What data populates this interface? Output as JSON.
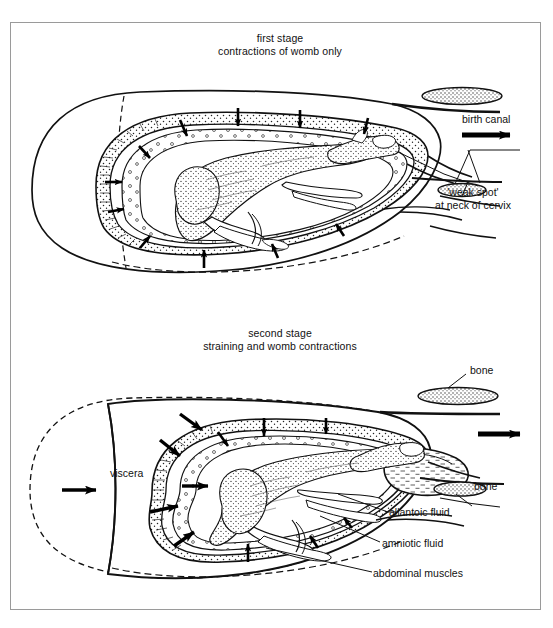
{
  "figure": {
    "background_color": "#ffffff",
    "ink_color": "#111111",
    "frame_color": "#9a9a9a"
  },
  "panels": [
    {
      "id": "first-stage",
      "caption": "first stage\ncontractions of womb only",
      "labels": [
        {
          "name": "birth-canal",
          "text": "birth canal"
        },
        {
          "name": "weak-spot",
          "text": "'weak spot'\nat neck of cervix"
        }
      ]
    },
    {
      "id": "second-stage",
      "caption": "second stage\nstraining and womb contractions",
      "labels": [
        {
          "name": "bone-top",
          "text": "bone"
        },
        {
          "name": "bone-bottom",
          "text": "bone"
        },
        {
          "name": "allantoic-fluid",
          "text": "allantoic fluid"
        },
        {
          "name": "amniotic-fluid",
          "text": "amniotic fluid"
        },
        {
          "name": "abdominal-muscles",
          "text": "abdominal muscles"
        },
        {
          "name": "viscera",
          "text": "viscera"
        }
      ]
    }
  ]
}
